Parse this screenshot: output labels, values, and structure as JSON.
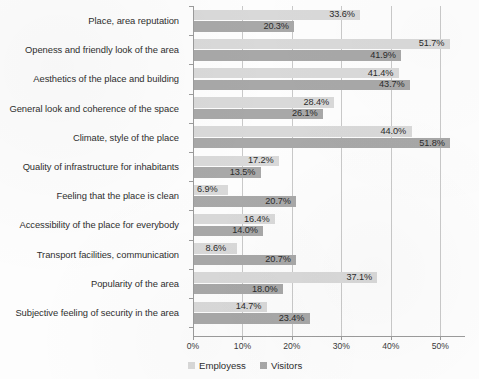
{
  "chart_data": {
    "type": "bar",
    "orientation": "horizontal",
    "title": "",
    "xlabel": "",
    "ylabel": "",
    "xlim": [
      0,
      55
    ],
    "grid": true,
    "legend_position": "bottom-left",
    "xticks": [
      "0%",
      "10%",
      "20%",
      "30%",
      "40%",
      "50%"
    ],
    "xtick_values": [
      0,
      10,
      20,
      30,
      40,
      50
    ],
    "categories": [
      "Place, area reputation",
      "Openess and friendly look of the area",
      "Aesthetics of the place and building",
      "General look and coherence of the space",
      "Climate, style of the place",
      "Quality of infrastructure for inhabitants",
      "Feeling that the place is clean",
      "Accessibility of the place for everybody",
      "Transport facilities, communication",
      "Popularity of the area",
      "Subjective feeling of security in the area"
    ],
    "series": [
      {
        "name": "Employess",
        "color": "#d9d9d9",
        "values": [
          33.6,
          51.7,
          41.4,
          28.4,
          44.0,
          17.2,
          6.9,
          16.4,
          8.6,
          37.1,
          14.7
        ],
        "labels": [
          "33.6%",
          "51.7%",
          "41.4%",
          "28.4%",
          "44.0%",
          "17.2%",
          "6.9%",
          "16.4%",
          "8.6%",
          "37.1%",
          "14.7%"
        ]
      },
      {
        "name": "Visitors",
        "color": "#a8a8a8",
        "values": [
          20.3,
          41.9,
          43.7,
          26.1,
          51.8,
          13.5,
          20.7,
          14.0,
          20.7,
          18.0,
          23.4
        ],
        "labels": [
          "20.3%",
          "41.9%",
          "43.7%",
          "26.1%",
          "51.8%",
          "13.5%",
          "20.7%",
          "14.0%",
          "20.7%",
          "18.0%",
          "23.4%"
        ]
      }
    ]
  },
  "legend": {
    "items": [
      {
        "label": "Employess",
        "key": "employess"
      },
      {
        "label": "Visitors",
        "key": "visitors"
      }
    ]
  }
}
